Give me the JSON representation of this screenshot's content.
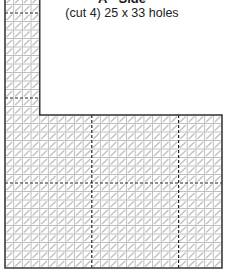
{
  "diagram": {
    "title": "A - Side",
    "subtitle": "(cut 4) 25 x 33 holes",
    "piece": {
      "columns": 25,
      "rows": 33,
      "notch_columns": 4,
      "lower_section_rows": 18,
      "dashed_line_interval": 10
    },
    "colors": {
      "outline": "#3a3a3a",
      "grid": "#b8b8b8",
      "diagonal": "#c4c4c4",
      "dashed": "#222222",
      "text": "#1a1a1a"
    }
  }
}
